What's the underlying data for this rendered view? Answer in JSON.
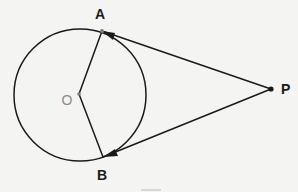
{
  "figure": {
    "type": "geometry-diagram",
    "background_color": "#f4f4f2",
    "stroke_color": "#1a1a1a",
    "center_label_color": "#8a8a8a",
    "canvas": {
      "width": 298,
      "height": 192
    },
    "circle": {
      "label": "circle-o",
      "center_x": 80,
      "center_y": 95,
      "radius": 66
    },
    "points": [
      {
        "id": "A",
        "label": "A",
        "x": 102,
        "y": 31,
        "label_x": 100,
        "label_y": 19,
        "color": "#1a1a1a"
      },
      {
        "id": "B",
        "label": "B",
        "x": 103,
        "y": 157,
        "label_x": 102,
        "label_y": 180,
        "color": "#1a1a1a"
      },
      {
        "id": "O",
        "label": "O",
        "x": 79,
        "y": 94,
        "label_x": 67,
        "label_y": 105,
        "color": "#8a8a8a"
      },
      {
        "id": "P",
        "label": "P",
        "x": 271,
        "y": 89,
        "label_x": 281,
        "label_y": 94,
        "color": "#1a1a1a"
      }
    ],
    "segments": [
      {
        "id": "OA",
        "from": "O",
        "to": "A",
        "arrow": "none"
      },
      {
        "id": "OB",
        "from": "O",
        "to": "B",
        "arrow": "none"
      },
      {
        "id": "PA",
        "from": "P",
        "to": "A",
        "arrow": "both"
      },
      {
        "id": "PB",
        "from": "P",
        "to": "B",
        "arrow": "both"
      }
    ],
    "bottom_mark": {
      "x": 141,
      "y": 189,
      "width": 20,
      "height": 2,
      "color": "#d9d9d9"
    }
  }
}
